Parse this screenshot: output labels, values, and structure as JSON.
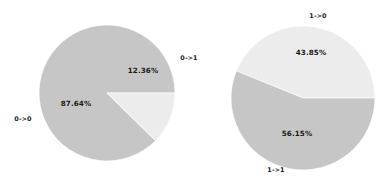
{
  "figure": {
    "background_color": "#ffffff",
    "width": 389,
    "height": 188
  },
  "palette": {
    "slice_grey": "#c6c6c6",
    "slice_light": "#ececec",
    "text": "#1a1a1a"
  },
  "chart_data": [
    {
      "type": "pie",
      "title": "",
      "subtitle": "",
      "xlabel": "",
      "ylabel": "",
      "legend_position": "none",
      "grid": false,
      "categories": [
        "0->0",
        "0->1"
      ],
      "values": [
        87.64,
        12.36
      ],
      "value_labels": [
        "87.64%",
        "12.36%"
      ],
      "colors": [
        "#c6c6c6",
        "#ececec"
      ],
      "start_angle": 0,
      "direction": "counterclockwise",
      "center": [
        107,
        93
      ],
      "radius": 68,
      "annotations": [
        {
          "text": "87.64%",
          "x": 76,
          "y": 104
        },
        {
          "text": "12.36%",
          "x": 143,
          "y": 71
        },
        {
          "text": "0->0",
          "x": 23,
          "y": 119
        },
        {
          "text": "0->1",
          "x": 189,
          "y": 58
        }
      ]
    },
    {
      "type": "pie",
      "title": "",
      "subtitle": "",
      "xlabel": "",
      "ylabel": "",
      "legend_position": "none",
      "grid": false,
      "categories": [
        "1->0",
        "1->1"
      ],
      "values": [
        43.85,
        56.15
      ],
      "value_labels": [
        "43.85%",
        "56.15%"
      ],
      "colors": [
        "#ececec",
        "#c6c6c6"
      ],
      "start_angle": 0,
      "direction": "counterclockwise",
      "center": [
        303,
        98
      ],
      "radius": 72,
      "annotations": [
        {
          "text": "43.85%",
          "x": 311,
          "y": 53
        },
        {
          "text": "56.15%",
          "x": 297,
          "y": 134
        },
        {
          "text": "1->0",
          "x": 318,
          "y": 16
        },
        {
          "text": "1->1",
          "x": 276,
          "y": 170
        }
      ]
    }
  ]
}
